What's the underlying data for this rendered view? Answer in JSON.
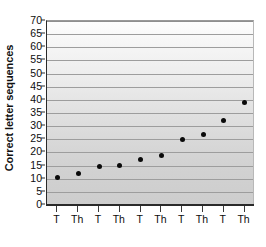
{
  "chart_data": {
    "type": "scatter",
    "title": "",
    "xlabel": "",
    "ylabel": "Correct letter sequences",
    "categories": [
      "T",
      "Th",
      "T",
      "Th",
      "T",
      "Th",
      "T",
      "Th",
      "T",
      "Th"
    ],
    "values": [
      10.5,
      12,
      14.5,
      15,
      17.5,
      19,
      25,
      27,
      32,
      39
    ],
    "ylim": [
      0,
      70
    ],
    "yticks": [
      0,
      5,
      10,
      15,
      20,
      25,
      30,
      35,
      40,
      45,
      50,
      55,
      60,
      65,
      70
    ],
    "ytick_labels": [
      "0",
      "5",
      "10",
      "15",
      "20",
      "25",
      "30",
      "35",
      "40",
      "45",
      "50",
      "55",
      "60",
      "65",
      "70"
    ],
    "grid": true,
    "grid_axis": "y",
    "legend": false,
    "legend_position": "none",
    "marker": "filled-circle",
    "marker_color": "#0a0a0a",
    "plot_background": "gray-vertical-gradient",
    "series": [
      {
        "name": "Correct letter sequences",
        "values": [
          10.5,
          12,
          14.5,
          15,
          17.5,
          19,
          25,
          27,
          32,
          39
        ]
      }
    ]
  }
}
